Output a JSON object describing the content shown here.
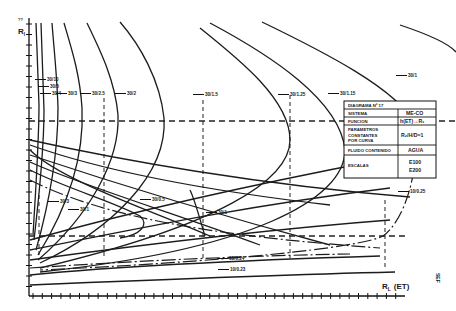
{
  "diagram": {
    "y_axis": {
      "label": "R",
      "subscript": "l",
      "top_marker": "??"
    },
    "x_axis": {
      "label": "R",
      "subscript": "L",
      "unit": "(ET)"
    },
    "side_note": "SEF",
    "info_table": {
      "title": "DIAGRAMA Nº 17",
      "rows": [
        {
          "key": "SISTEMA",
          "value": "ME-CO"
        },
        {
          "key": "FUNCION",
          "value": "h(ET)→R₁"
        },
        {
          "key": "PARAMETROS CONSTANTES POR CURVA",
          "key_lines": [
            "PARAMETROS",
            "CONSTANTES",
            "POR CURVA"
          ],
          "value": "R₂/H/D=1"
        },
        {
          "key": "FLUIDO CONTENIDO",
          "value": "AGUA"
        },
        {
          "key": "ESCALAS",
          "value_lines": [
            "E100",
            "E200"
          ]
        }
      ]
    },
    "upper_curve_labels": [
      "30/10",
      "30/5",
      "30/4",
      "30/3",
      "30/2.5",
      "30/2",
      "30/1.5",
      "30/1.25",
      "30/1.15",
      "30/1"
    ],
    "lower_curve_labels": [
      "30/3",
      "30/1",
      "30/0.5",
      "30/1",
      "10/0.25",
      "10/0.24",
      "10/0.23"
    ],
    "labels": [
      {
        "id": "l1",
        "text": "30/10",
        "x": 47,
        "y": 81
      },
      {
        "id": "l2",
        "text": "30/5",
        "x": 50,
        "y": 88
      },
      {
        "id": "l3",
        "text": "30/4",
        "x": 52,
        "y": 95
      },
      {
        "id": "l4",
        "text": "30/3",
        "x": 68,
        "y": 95
      },
      {
        "id": "l5",
        "text": "30/2.5",
        "x": 92,
        "y": 95
      },
      {
        "id": "l6",
        "text": "30/2",
        "x": 127,
        "y": 95
      },
      {
        "id": "l7",
        "text": "30/1.5",
        "x": 205,
        "y": 96
      },
      {
        "id": "l8",
        "text": "30/1.25",
        "x": 290,
        "y": 96
      },
      {
        "id": "l9",
        "text": "30/1.15",
        "x": 340,
        "y": 95
      },
      {
        "id": "l10",
        "text": "30/1",
        "x": 408,
        "y": 77
      },
      {
        "id": "l11",
        "text": "30/3",
        "x": 60,
        "y": 203
      },
      {
        "id": "l12",
        "text": "30/1",
        "x": 80,
        "y": 211
      },
      {
        "id": "l13",
        "text": "30/0.5",
        "x": 152,
        "y": 201
      },
      {
        "id": "l14",
        "text": "30/1",
        "x": 218,
        "y": 214
      },
      {
        "id": "l15",
        "text": "10/0.25",
        "x": 410,
        "y": 193
      },
      {
        "id": "l16",
        "text": "10/0.24",
        "x": 229,
        "y": 260
      },
      {
        "id": "l17",
        "text": "10/0.23",
        "x": 230,
        "y": 271
      }
    ],
    "upper_curves": [
      "M36 23 C37 50 38 75 39 105 C39 140 37 170 33 235",
      "M41 23 C42 50 43 80 44 110 C44 145 41 180 34 240",
      "M52 23 C54 50 57 75 58 108 C58 150 50 200 36 250",
      "M64 23 C72 50 80 75 82 108 C84 150 72 200 38 255",
      "M87 23 C100 50 115 80 118 115 C120 160 90 215 38 260",
      "M120 22 C140 45 160 80 164 118 C168 175 110 230 40 263",
      "M200 28 C240 60 290 100 290 140 C290 180 220 225 40 268",
      "M210 23 C270 55 340 100 345 150 C345 200 250 250 40 272",
      "M262 22 C320 50 400 90 415 125",
      "M400 25 C430 35 450 45 456 52"
    ],
    "dashed_upper_curves": [
      "M415 125 C420 170 405 220 383 236 C360 248 220 262 40 270"
    ],
    "lower_curves": [
      "M30 140 C120 160 260 185 410 197",
      "M30 145 C100 170 200 190 330 205",
      "M30 155 C90 175 200 210 330 245",
      "M30 162 C80 185 180 215 260 245",
      "M30 150 C60 180 150 210 210 236",
      "M30 240 C120 215 250 185 380 160",
      "M30 250 C130 230 250 205 390 188",
      "M30 260 C140 245 260 230 390 220",
      "M30 275 C120 266 250 260 380 256",
      "M30 285 C150 280 270 275 395 272"
    ],
    "dashed_lower_curves": [
      "M30 180 C100 215 200 235 380 248",
      "M30 268 C120 262 230 256 350 254"
    ],
    "loops": [
      "M30 170 C70 190 110 200 140 216 C150 225 140 235 120 238",
      "M205 236 C200 220 195 200 190 190"
    ],
    "guides": {
      "h_upper_y": 121,
      "h_lower_y": 236,
      "v_lines_x": [
        39,
        104,
        203,
        290,
        385
      ]
    },
    "colors": {
      "ink": "#1c1c1c",
      "paper": "#ffffff"
    }
  }
}
